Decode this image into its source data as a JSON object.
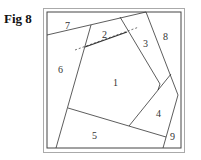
{
  "figure": {
    "label": "Fig 8",
    "colors": {
      "line": "#333333",
      "frame_outer": "#aaaaaa",
      "frame_inner": "#444444"
    }
  },
  "pieces": [
    {
      "number": "1",
      "x": 116,
      "y": 83
    },
    {
      "number": "2",
      "x": 105,
      "y": 35
    },
    {
      "number": "3",
      "x": 146,
      "y": 44
    },
    {
      "number": "4",
      "x": 159,
      "y": 114
    },
    {
      "number": "5",
      "x": 95,
      "y": 136
    },
    {
      "number": "6",
      "x": 61,
      "y": 70
    },
    {
      "number": "7",
      "x": 68,
      "y": 26
    },
    {
      "number": "8",
      "x": 166,
      "y": 37
    },
    {
      "number": "9",
      "x": 173,
      "y": 137
    }
  ]
}
